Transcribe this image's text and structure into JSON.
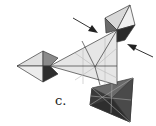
{
  "figure": {
    "label": "c.",
    "colors": {
      "light": "#e4e4e4",
      "mid": "#bdbdbd",
      "dark": "#5a5a5a",
      "darker": "#2e2e2e",
      "line": "#3a3a3a"
    },
    "arrows": [
      {
        "name": "arrow-top-left",
        "from": [
          73,
          18
        ],
        "to": [
          97,
          32
        ]
      },
      {
        "name": "arrow-right",
        "from": [
          153,
          57
        ],
        "to": [
          128,
          45
        ]
      }
    ]
  }
}
